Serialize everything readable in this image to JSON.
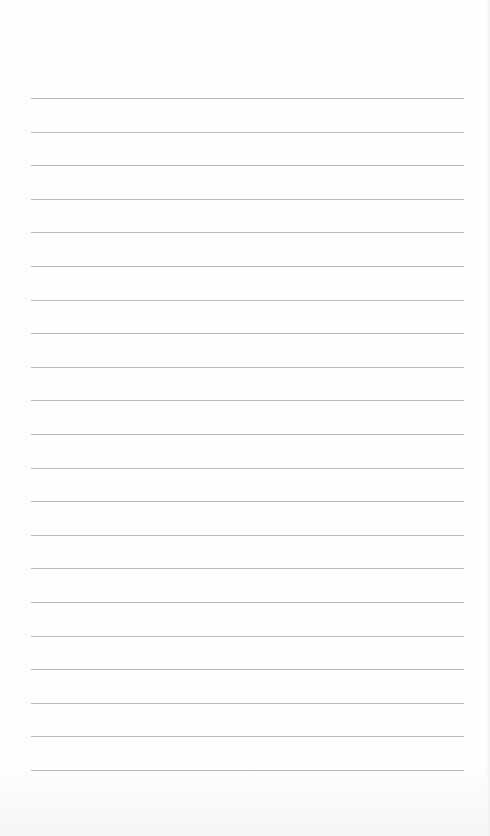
{
  "page": {
    "type": "lined-paper",
    "background_color": "#fefefe",
    "rule_color": "#b9b9b9",
    "rule_count": 21,
    "rule_left": 31,
    "rule_width": 433,
    "first_rule_y": 98,
    "rule_spacing": 33.6
  }
}
